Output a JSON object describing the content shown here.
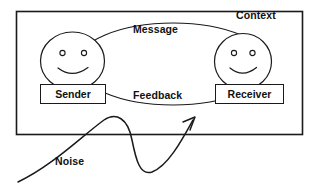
{
  "diagram": {
    "outer_frame": {
      "label": "Context",
      "stroke_color": "#1a1a1a"
    },
    "channel_ellipse": {
      "top_label": "Message",
      "bottom_label": "Feedback",
      "stroke_color": "#1a1a1a"
    },
    "actors": [
      {
        "id": "sender",
        "label": "Sender",
        "face": "smiley-face"
      },
      {
        "id": "receiver",
        "label": "Receiver",
        "face": "smiley-face"
      }
    ],
    "noise": {
      "label": "Noise",
      "shape": "wavy-arrow",
      "stroke_color": "#1a1a1a"
    },
    "colors": {
      "background": "#ffffff",
      "ink": "#1a1a1a",
      "text": "#111111"
    }
  }
}
